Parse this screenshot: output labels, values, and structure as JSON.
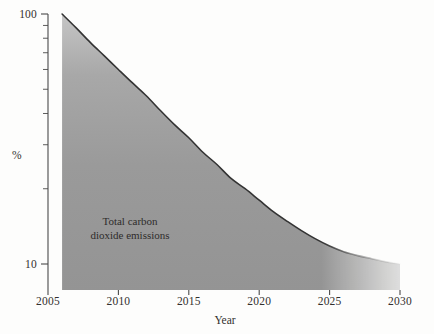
{
  "chart_data": {
    "type": "area",
    "title": "",
    "xlabel": "Year",
    "ylabel": "%",
    "yscale": "log",
    "xlim": [
      2005,
      2030
    ],
    "ylim": [
      10,
      100
    ],
    "grid": false,
    "legend": "none",
    "annotation": {
      "line1": "Total carbon",
      "line2": "dioxide emissions"
    },
    "xticks": [
      "2005",
      "2010",
      "2015",
      "2020",
      "2025",
      "2030"
    ],
    "xtick_values": [
      2005,
      2010,
      2015,
      2020,
      2025,
      2030
    ],
    "yticks": [
      "100",
      "10"
    ],
    "ytick_values": [
      100,
      10
    ],
    "yminor_values": [
      90,
      80,
      70,
      60,
      50,
      40,
      30,
      20
    ],
    "series": [
      {
        "name": "Total carbon dioxide emissions",
        "x": [
          2006,
          2007,
          2008,
          2009,
          2010,
          2011,
          2012,
          2013,
          2014,
          2015,
          2016,
          2017,
          2018,
          2019,
          2020,
          2021,
          2022,
          2023,
          2024,
          2025,
          2026,
          2027,
          2028,
          2029,
          2030
        ],
        "values": [
          100,
          88,
          77,
          68,
          60,
          53,
          47,
          41,
          36,
          32,
          28,
          25,
          22,
          20,
          18,
          16.2,
          14.8,
          13.6,
          12.6,
          11.8,
          11.2,
          10.8,
          10.5,
          10.2,
          10
        ]
      }
    ],
    "colors": {
      "fill": "#9a9a9a",
      "fill_light": "#c9c9c9",
      "line": "#3a3a3a",
      "axis": "#4a4a4a",
      "background": "#fdfdfc"
    }
  }
}
